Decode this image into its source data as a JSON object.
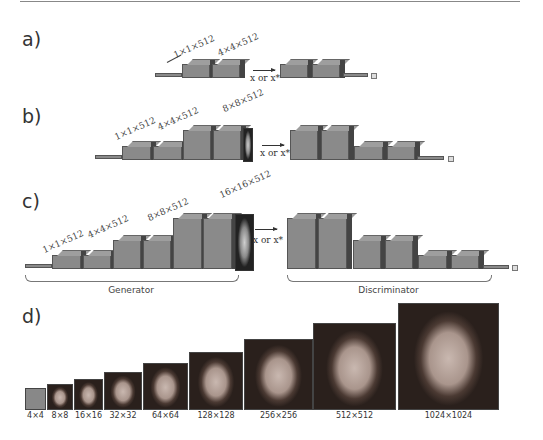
{
  "panels": {
    "a": {
      "label": "a)",
      "dims": [
        "1×1×512",
        "4×4×512"
      ],
      "input_label": "x or x*"
    },
    "b": {
      "label": "b)",
      "dims": [
        "1×1×512",
        "4×4×512",
        "8×8×512"
      ],
      "input_label": "x or x*"
    },
    "c": {
      "label": "c)",
      "dims": [
        "1×1×512",
        "4×4×512",
        "8×8×512",
        "16×16×512"
      ],
      "input_label": "x or x*",
      "generator_label": "Generator",
      "discriminator_label": "Discriminator"
    },
    "d": {
      "label": "d)",
      "resolutions": [
        "4×4",
        "8×8",
        "16×16",
        "32×32",
        "64×64",
        "128×128",
        "256×256",
        "512×512",
        "1024×1024"
      ]
    }
  }
}
